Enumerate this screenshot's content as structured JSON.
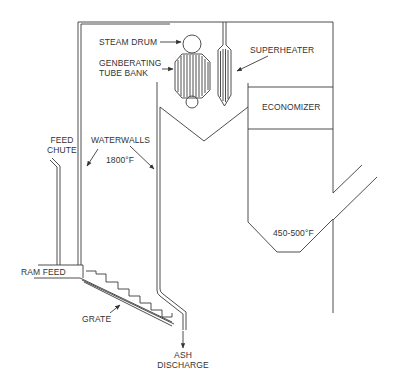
{
  "diagram": {
    "type": "process-schematic",
    "line_color": "#3a3a3a",
    "background": "#ffffff"
  },
  "labels": {
    "steam_drum": "STEAM DRUM",
    "generating_tube_bank_line1": "GENBERATING",
    "generating_tube_bank_line2": "TUBE BANK",
    "superheater": "SUPERHEATER",
    "economizer": "ECONOMIZER",
    "feed_chute_line1": "FEED",
    "feed_chute_line2": "CHUTE",
    "waterwalls": "WATERWALLS",
    "furnace_temp": "1800°F",
    "exit_temp": "450-500°F",
    "ram_feed": "RAM FEED",
    "grate": "GRATE",
    "ash_discharge_line1": "ASH",
    "ash_discharge_line2": "DISCHARGE"
  },
  "components": [
    {
      "id": "steam-drum",
      "label": "STEAM DRUM"
    },
    {
      "id": "generating-tube-bank",
      "label": "GENBERATING TUBE BANK"
    },
    {
      "id": "superheater",
      "label": "SUPERHEATER"
    },
    {
      "id": "economizer",
      "label": "ECONOMIZER"
    },
    {
      "id": "feed-chute",
      "label": "FEED CHUTE"
    },
    {
      "id": "waterwalls",
      "label": "WATERWALLS"
    },
    {
      "id": "ram-feed",
      "label": "RAM FEED"
    },
    {
      "id": "grate",
      "label": "GRATE"
    },
    {
      "id": "ash-discharge",
      "label": "ASH DISCHARGE"
    }
  ],
  "temperatures": {
    "furnace": "1800°F",
    "flue_exit": "450-500°F"
  }
}
